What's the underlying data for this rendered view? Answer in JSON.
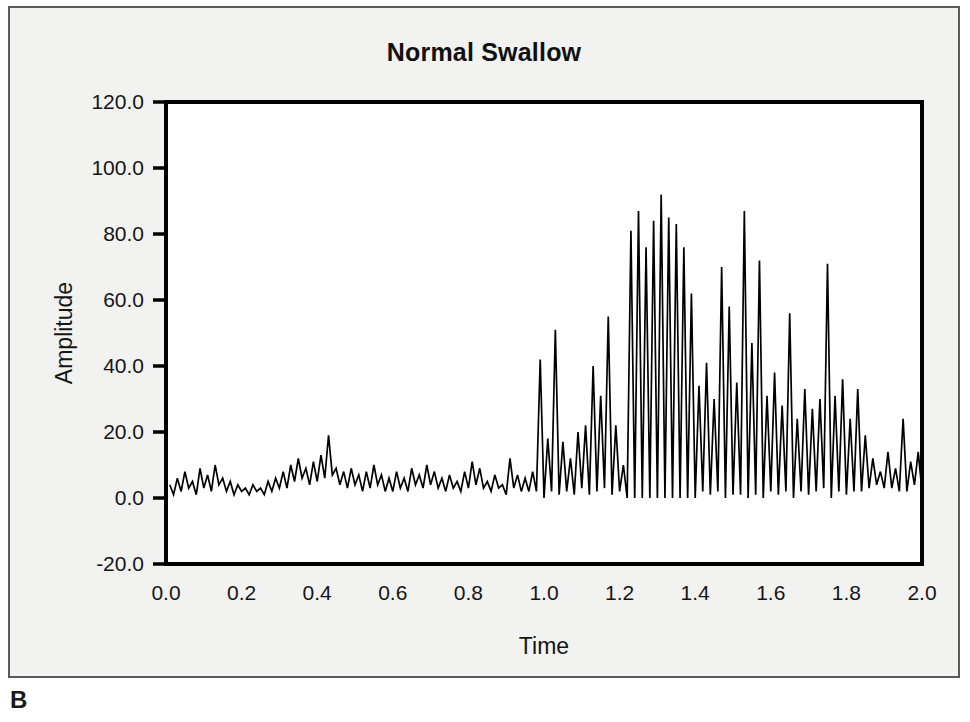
{
  "figure": {
    "panel_letter": "B",
    "background_color": "#f2f2f0",
    "border_color": "#5a5a5a",
    "trace_color": "#000000"
  },
  "chart_data": {
    "type": "line",
    "title": "Normal Swallow",
    "xlabel": "Time",
    "ylabel": "Amplitude",
    "xlim": [
      0.0,
      2.0
    ],
    "ylim": [
      -20.0,
      120.0
    ],
    "grid": false,
    "legend": null,
    "xticks": [
      "0.0",
      "0.2",
      "0.4",
      "0.6",
      "0.8",
      "1.0",
      "1.2",
      "1.4",
      "1.6",
      "1.8",
      "2.0"
    ],
    "xtick_values": [
      0.0,
      0.2,
      0.4,
      0.6,
      0.8,
      1.0,
      1.2,
      1.4,
      1.6,
      1.8,
      2.0
    ],
    "yticks": [
      "120.0",
      "100.0",
      "80.0",
      "60.0",
      "40.0",
      "20.0",
      "0.0",
      "-20.0"
    ],
    "ytick_values": [
      120.0,
      100.0,
      80.0,
      60.0,
      40.0,
      20.0,
      0.0,
      -20.0
    ],
    "series": [
      {
        "name": "Normal Swallow",
        "x": [
          0.01,
          0.02,
          0.03,
          0.04,
          0.05,
          0.06,
          0.07,
          0.08,
          0.09,
          0.1,
          0.11,
          0.12,
          0.13,
          0.14,
          0.15,
          0.16,
          0.17,
          0.18,
          0.19,
          0.2,
          0.21,
          0.22,
          0.23,
          0.24,
          0.25,
          0.26,
          0.27,
          0.28,
          0.29,
          0.3,
          0.31,
          0.32,
          0.33,
          0.34,
          0.35,
          0.36,
          0.37,
          0.38,
          0.39,
          0.4,
          0.41,
          0.42,
          0.43,
          0.44,
          0.45,
          0.46,
          0.47,
          0.48,
          0.49,
          0.5,
          0.51,
          0.52,
          0.53,
          0.54,
          0.55,
          0.56,
          0.57,
          0.58,
          0.59,
          0.6,
          0.61,
          0.62,
          0.63,
          0.64,
          0.65,
          0.66,
          0.67,
          0.68,
          0.69,
          0.7,
          0.71,
          0.72,
          0.73,
          0.74,
          0.75,
          0.76,
          0.77,
          0.78,
          0.79,
          0.8,
          0.81,
          0.82,
          0.83,
          0.84,
          0.85,
          0.86,
          0.87,
          0.88,
          0.89,
          0.9,
          0.91,
          0.92,
          0.93,
          0.94,
          0.95,
          0.96,
          0.97,
          0.98,
          0.99,
          1.0,
          1.01,
          1.02,
          1.03,
          1.04,
          1.05,
          1.06,
          1.07,
          1.08,
          1.09,
          1.1,
          1.11,
          1.12,
          1.13,
          1.14,
          1.15,
          1.16,
          1.17,
          1.18,
          1.19,
          1.2,
          1.21,
          1.22,
          1.23,
          1.24,
          1.25,
          1.26,
          1.27,
          1.28,
          1.29,
          1.3,
          1.31,
          1.32,
          1.33,
          1.34,
          1.35,
          1.36,
          1.37,
          1.38,
          1.39,
          1.4,
          1.41,
          1.42,
          1.43,
          1.44,
          1.45,
          1.46,
          1.47,
          1.48,
          1.49,
          1.5,
          1.51,
          1.52,
          1.53,
          1.54,
          1.55,
          1.56,
          1.57,
          1.58,
          1.59,
          1.6,
          1.61,
          1.62,
          1.63,
          1.64,
          1.65,
          1.66,
          1.67,
          1.68,
          1.69,
          1.7,
          1.71,
          1.72,
          1.73,
          1.74,
          1.75,
          1.76,
          1.77,
          1.78,
          1.79,
          1.8,
          1.81,
          1.82,
          1.83,
          1.84,
          1.85,
          1.86,
          1.87,
          1.88,
          1.89,
          1.9,
          1.91,
          1.92,
          1.93,
          1.94,
          1.95,
          1.96,
          1.97,
          1.98,
          1.99,
          2.0
        ],
        "values": [
          4,
          1,
          6,
          2,
          8,
          3,
          5,
          1,
          9,
          3,
          7,
          2,
          10,
          4,
          6,
          2,
          5,
          1,
          4,
          2,
          3,
          1,
          4,
          2,
          3,
          1,
          5,
          2,
          6,
          3,
          8,
          3,
          10,
          5,
          12,
          6,
          9,
          4,
          11,
          5,
          13,
          6,
          19,
          7,
          9,
          4,
          8,
          3,
          9,
          4,
          7,
          2,
          8,
          3,
          10,
          4,
          7,
          2,
          6,
          2,
          8,
          3,
          6,
          2,
          9,
          4,
          7,
          3,
          10,
          4,
          8,
          3,
          6,
          2,
          7,
          3,
          5,
          2,
          8,
          3,
          11,
          4,
          9,
          3,
          5,
          2,
          7,
          3,
          4,
          1,
          12,
          3,
          7,
          2,
          6,
          2,
          8,
          2,
          42,
          0,
          18,
          2,
          51,
          1,
          17,
          2,
          12,
          1,
          20,
          3,
          22,
          1,
          40,
          2,
          31,
          3,
          55,
          1,
          22,
          2,
          10,
          0,
          81,
          0,
          87,
          0,
          76,
          0,
          84,
          0,
          92,
          0,
          85,
          0,
          83,
          0,
          76,
          0,
          62,
          0,
          34,
          2,
          41,
          1,
          30,
          2,
          70,
          0,
          58,
          1,
          35,
          1,
          87,
          0,
          47,
          1,
          72,
          0,
          31,
          2,
          38,
          1,
          28,
          2,
          56,
          0,
          24,
          2,
          33,
          1,
          27,
          2,
          30,
          3,
          71,
          0,
          31,
          2,
          36,
          1,
          24,
          2,
          33,
          2,
          19,
          3,
          12,
          4,
          8,
          3,
          14,
          3,
          9,
          2,
          24,
          2,
          11,
          4,
          14,
          2
        ]
      }
    ]
  }
}
